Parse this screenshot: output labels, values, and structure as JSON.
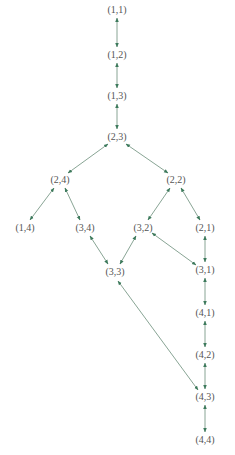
{
  "diagram": {
    "type": "directed-graph",
    "edge_style": "bidirectional",
    "colors": {
      "edge": "#7a9a88",
      "arrowhead": "#3d7a5c",
      "label": "#555555"
    },
    "nodes": [
      {
        "id": "n11",
        "label": "(1,1)",
        "x": 117,
        "y": 10
      },
      {
        "id": "n12",
        "label": "(1,2)",
        "x": 117,
        "y": 55
      },
      {
        "id": "n13",
        "label": "(1,3)",
        "x": 117,
        "y": 96
      },
      {
        "id": "n23",
        "label": "(2,3)",
        "x": 117,
        "y": 137
      },
      {
        "id": "n24",
        "label": "(2,4)",
        "x": 60,
        "y": 180
      },
      {
        "id": "n22",
        "label": "(2,2)",
        "x": 176,
        "y": 180
      },
      {
        "id": "n14",
        "label": "(1,4)",
        "x": 25,
        "y": 228
      },
      {
        "id": "n34",
        "label": "(3,4)",
        "x": 85,
        "y": 228
      },
      {
        "id": "n32",
        "label": "(3,2)",
        "x": 143,
        "y": 228
      },
      {
        "id": "n21",
        "label": "(2,1)",
        "x": 205,
        "y": 228
      },
      {
        "id": "n33",
        "label": "(3,3)",
        "x": 115,
        "y": 272
      },
      {
        "id": "n31",
        "label": "(3,1)",
        "x": 205,
        "y": 270
      },
      {
        "id": "n41",
        "label": "(4,1)",
        "x": 205,
        "y": 313
      },
      {
        "id": "n42",
        "label": "(4,2)",
        "x": 205,
        "y": 355
      },
      {
        "id": "n43",
        "label": "(4,3)",
        "x": 205,
        "y": 397
      },
      {
        "id": "n44",
        "label": "(4,4)",
        "x": 205,
        "y": 440
      }
    ],
    "edges": [
      {
        "from": "n11",
        "to": "n12",
        "x1": 117,
        "y1": 18,
        "x2": 117,
        "y2": 47
      },
      {
        "from": "n12",
        "to": "n13",
        "x1": 117,
        "y1": 63,
        "x2": 117,
        "y2": 88
      },
      {
        "from": "n13",
        "to": "n23",
        "x1": 117,
        "y1": 104,
        "x2": 117,
        "y2": 129
      },
      {
        "from": "n23",
        "to": "n24",
        "x1": 108,
        "y1": 144,
        "x2": 68,
        "y2": 173
      },
      {
        "from": "n23",
        "to": "n22",
        "x1": 126,
        "y1": 144,
        "x2": 168,
        "y2": 173
      },
      {
        "from": "n24",
        "to": "n14",
        "x1": 54,
        "y1": 188,
        "x2": 30,
        "y2": 220
      },
      {
        "from": "n24",
        "to": "n34",
        "x1": 65,
        "y1": 188,
        "x2": 80,
        "y2": 220
      },
      {
        "from": "n22",
        "to": "n32",
        "x1": 170,
        "y1": 188,
        "x2": 148,
        "y2": 220
      },
      {
        "from": "n22",
        "to": "n21",
        "x1": 181,
        "y1": 188,
        "x2": 200,
        "y2": 220
      },
      {
        "from": "n34",
        "to": "n33",
        "x1": 90,
        "y1": 236,
        "x2": 108,
        "y2": 264
      },
      {
        "from": "n32",
        "to": "n33",
        "x1": 136,
        "y1": 236,
        "x2": 120,
        "y2": 264
      },
      {
        "from": "n32",
        "to": "n31",
        "x1": 152,
        "y1": 233,
        "x2": 196,
        "y2": 265
      },
      {
        "from": "n21",
        "to": "n31",
        "x1": 205,
        "y1": 236,
        "x2": 205,
        "y2": 262
      },
      {
        "from": "n31",
        "to": "n41",
        "x1": 205,
        "y1": 278,
        "x2": 205,
        "y2": 305
      },
      {
        "from": "n41",
        "to": "n42",
        "x1": 205,
        "y1": 321,
        "x2": 205,
        "y2": 347
      },
      {
        "from": "n42",
        "to": "n43",
        "x1": 205,
        "y1": 363,
        "x2": 205,
        "y2": 389
      },
      {
        "from": "n43",
        "to": "n44",
        "x1": 205,
        "y1": 405,
        "x2": 205,
        "y2": 432
      },
      {
        "from": "n33",
        "to": "n43",
        "x1": 118,
        "y1": 281,
        "x2": 198,
        "y2": 390
      }
    ]
  }
}
